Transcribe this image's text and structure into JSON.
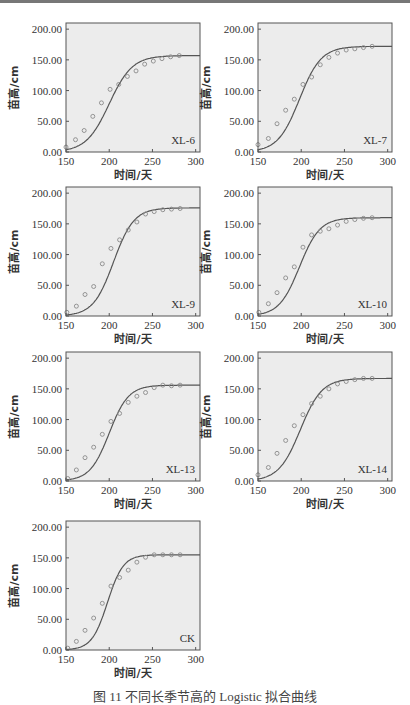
{
  "figure": {
    "caption": "图 11  不同长季节高的 Logistic 拟合曲线"
  },
  "axis": {
    "xlabel": "时间/天",
    "ylabel": "苗高/cm",
    "xlim": [
      150,
      305
    ],
    "ylim": [
      0,
      210
    ],
    "xticks": [
      150,
      200,
      250,
      300
    ],
    "yticks": [
      0,
      50,
      100,
      150,
      200
    ],
    "ytick_labels": [
      "0.00",
      "50.00",
      "100.00",
      "150.00",
      "200.00"
    ]
  },
  "colors": {
    "plot_bg": "#ececec",
    "frame": "#555555",
    "curve": "#555555",
    "marker": "#8a8a8a"
  },
  "chart_data": [
    {
      "type": "scatter+line",
      "title": "XL-6",
      "xlabel": "时间/天",
      "ylabel": "苗高/cm",
      "xlim": [
        150,
        305
      ],
      "ylim": [
        0,
        210
      ],
      "fit": {
        "model": "logistic",
        "K": 157,
        "r": 0.075,
        "t0": 200
      },
      "x": [
        150,
        161,
        171,
        181,
        191,
        201,
        211,
        221,
        231,
        241,
        251,
        261,
        271,
        281
      ],
      "y": [
        8,
        20,
        35,
        58,
        80,
        102,
        110,
        123,
        132,
        143,
        148,
        152,
        155,
        157
      ]
    },
    {
      "type": "scatter+line",
      "title": "XL-7",
      "xlabel": "时间/天",
      "ylabel": "苗高/cm",
      "xlim": [
        150,
        305
      ],
      "ylim": [
        0,
        210
      ],
      "fit": {
        "model": "logistic",
        "K": 172,
        "r": 0.08,
        "t0": 198
      },
      "x": [
        150,
        162,
        172,
        182,
        192,
        202,
        212,
        222,
        232,
        242,
        252,
        262,
        272,
        282
      ],
      "y": [
        12,
        22,
        46,
        68,
        86,
        110,
        122,
        142,
        154,
        161,
        166,
        168,
        170,
        172
      ]
    },
    {
      "type": "scatter+line",
      "title": "XL-9",
      "xlabel": "时间/天",
      "ylabel": "苗高/cm",
      "xlim": [
        150,
        305
      ],
      "ylim": [
        0,
        210
      ],
      "fit": {
        "model": "logistic",
        "K": 176,
        "r": 0.085,
        "t0": 205
      },
      "x": [
        151,
        162,
        172,
        182,
        192,
        202,
        212,
        222,
        232,
        242,
        252,
        262,
        272,
        282
      ],
      "y": [
        6,
        16,
        35,
        48,
        85,
        110,
        124,
        140,
        153,
        166,
        170,
        173,
        174,
        175
      ]
    },
    {
      "type": "scatter+line",
      "title": "XL-10",
      "xlabel": "时间/天",
      "ylabel": "苗高/cm",
      "xlim": [
        150,
        305
      ],
      "ylim": [
        0,
        210
      ],
      "fit": {
        "model": "logistic",
        "K": 160,
        "r": 0.085,
        "t0": 198
      },
      "x": [
        151,
        162,
        172,
        182,
        192,
        202,
        212,
        222,
        232,
        242,
        252,
        262,
        272,
        282
      ],
      "y": [
        6,
        20,
        38,
        62,
        80,
        112,
        132,
        138,
        142,
        148,
        154,
        157,
        159,
        160
      ]
    },
    {
      "type": "scatter+line",
      "title": "XL-13",
      "xlabel": "时间/天",
      "ylabel": "苗高/cm",
      "xlim": [
        150,
        305
      ],
      "ylim": [
        0,
        210
      ],
      "fit": {
        "model": "logistic",
        "K": 156,
        "r": 0.09,
        "t0": 200
      },
      "x": [
        152,
        162,
        172,
        182,
        192,
        202,
        212,
        222,
        232,
        242,
        252,
        262,
        272,
        282
      ],
      "y": [
        4,
        18,
        38,
        55,
        76,
        97,
        110,
        128,
        138,
        144,
        152,
        156,
        155,
        156
      ]
    },
    {
      "type": "scatter+line",
      "title": "XL-14",
      "xlabel": "时间/天",
      "ylabel": "苗高/cm",
      "xlim": [
        150,
        305
      ],
      "ylim": [
        0,
        210
      ],
      "fit": {
        "model": "logistic",
        "K": 167,
        "r": 0.08,
        "t0": 199
      },
      "x": [
        150,
        162,
        172,
        182,
        192,
        202,
        212,
        222,
        232,
        242,
        252,
        262,
        272,
        282
      ],
      "y": [
        10,
        22,
        45,
        66,
        90,
        108,
        126,
        138,
        150,
        158,
        162,
        165,
        167,
        167
      ]
    },
    {
      "type": "scatter+line",
      "title": "CK",
      "xlabel": "时间/天",
      "ylabel": "苗高/cm",
      "xlim": [
        150,
        305
      ],
      "ylim": [
        0,
        210
      ],
      "fit": {
        "model": "logistic",
        "K": 155,
        "r": 0.11,
        "t0": 198
      },
      "x": [
        152,
        162,
        172,
        182,
        192,
        202,
        212,
        222,
        232,
        242,
        252,
        262,
        272,
        282
      ],
      "y": [
        3,
        14,
        32,
        52,
        76,
        104,
        118,
        130,
        143,
        151,
        155,
        155,
        155,
        155
      ]
    }
  ]
}
